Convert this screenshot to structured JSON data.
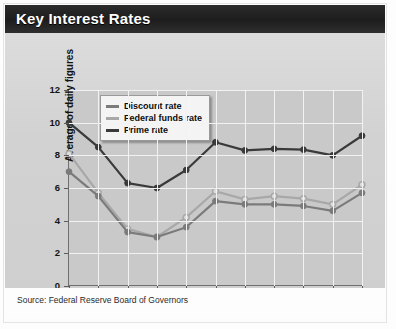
{
  "header": {
    "title": "Key Interest Rates"
  },
  "source": {
    "text": "Source: Federal Reserve Board of Governors"
  },
  "colors": {
    "prime": "#3a3a3a",
    "discount": "#7b7b7b",
    "federal_funds": "#a8a8a8",
    "plot_background": "#c9c9c9",
    "panel_background": "#d4d4d4",
    "header_background": "#232323",
    "gridline": "#f2f2f2",
    "axis": "#6f6f6f"
  },
  "chart_data": {
    "type": "line",
    "title": "Key Interest Rates",
    "xlabel": "Year",
    "ylabel": "Average of daily figures",
    "categories": [
      "1990",
      "1991",
      "1992",
      "1993",
      "1994",
      "1995",
      "1996",
      "1997",
      "1998",
      "1999",
      "2000"
    ],
    "x": [
      1990,
      1991,
      1992,
      1993,
      1994,
      1995,
      1996,
      1997,
      1998,
      1999,
      2000
    ],
    "xlim": [
      1990,
      2000
    ],
    "ylim": [
      0,
      12
    ],
    "yticks": [
      0,
      2,
      4,
      6,
      8,
      10,
      12
    ],
    "xticks": [
      1990,
      1991,
      1992,
      1993,
      1994,
      1995,
      1996,
      1997,
      1998,
      1999,
      2000
    ],
    "grid": true,
    "legend_position": "top-left-inside",
    "series": [
      {
        "name": "Discount rate",
        "color": "#7b7b7b",
        "marker": "filled-circle",
        "values": [
          7.0,
          5.5,
          3.3,
          3.0,
          3.6,
          5.2,
          5.0,
          5.0,
          4.9,
          4.6,
          5.7
        ]
      },
      {
        "name": "Federal funds rate",
        "color": "#a8a8a8",
        "marker": "open-circle",
        "values": [
          8.1,
          5.7,
          3.5,
          3.0,
          4.2,
          5.8,
          5.3,
          5.5,
          5.35,
          5.0,
          6.2
        ]
      },
      {
        "name": "Prime rate",
        "color": "#3a3a3a",
        "marker": "filled-circle",
        "values": [
          10.0,
          8.5,
          6.3,
          6.0,
          7.1,
          8.8,
          8.3,
          8.4,
          8.35,
          8.0,
          9.2
        ]
      }
    ]
  }
}
